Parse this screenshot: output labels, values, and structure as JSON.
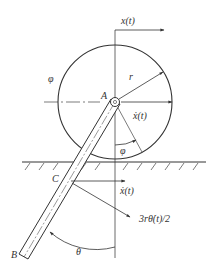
{
  "diagram": {
    "labels": {
      "x_t": "x(t)",
      "phi_upper": "φ",
      "r": "r",
      "A": "A",
      "x_dot_upper": "ẋ(t)",
      "varphi": "φ",
      "C": "C",
      "x_dot_lower": "ẋ(t)",
      "rod_velocity": "3rθ̇(t)/2",
      "B": "B",
      "theta": "θ"
    },
    "colors": {
      "stroke": "#333333",
      "background": "#ffffff"
    }
  }
}
